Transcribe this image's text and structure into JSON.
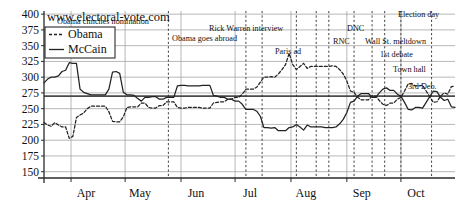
{
  "site_title": "www.electoral-vote.com",
  "legend": {
    "position": "top-left-inside",
    "entries": [
      {
        "name": "Obama",
        "style": "dashed"
      },
      {
        "name": "McCain",
        "style": "solid"
      }
    ]
  },
  "axes": {
    "y_ticks": [
      150,
      175,
      200,
      225,
      250,
      275,
      300,
      325,
      350,
      375,
      400
    ],
    "x_ticks": [
      "Apr",
      "May",
      "Jun",
      "Jul",
      "Aug",
      "Sep",
      "Oct"
    ]
  },
  "events": [
    {
      "label": "Obama clinches nomination",
      "x_day": 69,
      "text_x": 57,
      "text_y": 24,
      "anchor": "start"
    },
    {
      "label": "Obama goes abroad",
      "x_day": 112,
      "text_x": 172,
      "text_y": 41,
      "anchor": "start"
    },
    {
      "label": "Rick Warren interview",
      "x_day": 140,
      "text_x": 209,
      "text_y": 31,
      "anchor": "start"
    },
    {
      "label": "Paris ad",
      "x_day": 121,
      "text_x": 275,
      "text_y": 54,
      "anchor": "start"
    },
    {
      "label": "DNC",
      "x_day": 151,
      "text_x": 347,
      "text_y": 31,
      "anchor": "start"
    },
    {
      "label": "RNC",
      "x_day": 158,
      "text_x": 333,
      "text_y": 44,
      "anchor": "start"
    },
    {
      "label": "Wall St. meltdown",
      "x_day": 172,
      "text_x": 365,
      "text_y": 44,
      "anchor": "start"
    },
    {
      "label": "1st debate",
      "x_day": 182,
      "text_x": 380,
      "text_y": 57,
      "anchor": "start"
    },
    {
      "label": "Town hall",
      "x_day": 189,
      "text_x": 393,
      "text_y": 72,
      "anchor": "start"
    },
    {
      "label": "3rd Deb.",
      "x_day": 198,
      "text_x": 408,
      "text_y": 89,
      "anchor": "start"
    },
    {
      "label": "Election day",
      "x_day": 215,
      "text_x": 398,
      "text_y": 17,
      "anchor": "start"
    }
  ],
  "chart_data": {
    "type": "line",
    "title": "www.electoral-vote.com",
    "subtitle": "Electoral vote predictions, 2008 US presidential election",
    "xlabel": "",
    "ylabel": "Electoral votes",
    "ylim": [
      140,
      405
    ],
    "yticks": [
      150,
      175,
      200,
      225,
      250,
      275,
      300,
      325,
      350,
      375,
      400
    ],
    "grid": true,
    "legend_position": "upper left",
    "reference_line": 270,
    "x_tick_labels": [
      "Apr",
      "May",
      "Jun",
      "Jul",
      "Aug",
      "Sep",
      "Oct"
    ],
    "x_tick_positions": [
      15,
      45,
      76,
      106,
      137,
      168,
      198
    ],
    "x_range": [
      0,
      228
    ],
    "series": [
      {
        "name": "Obama",
        "style": "dashed",
        "color": "#222222",
        "x": [
          0,
          2,
          4,
          6,
          8,
          10,
          12,
          14,
          16,
          18,
          20,
          22,
          24,
          26,
          28,
          30,
          32,
          34,
          36,
          38,
          40,
          42,
          44,
          46,
          48,
          50,
          52,
          54,
          56,
          58,
          60,
          62,
          64,
          66,
          68,
          70,
          72,
          74,
          76,
          78,
          80,
          82,
          84,
          86,
          88,
          90,
          92,
          94,
          96,
          98,
          100,
          102,
          104,
          106,
          108,
          110,
          112,
          114,
          116,
          118,
          120,
          122,
          124,
          126,
          128,
          130,
          132,
          134,
          136,
          138,
          140,
          142,
          144,
          146,
          148,
          150,
          152,
          154,
          156,
          158,
          160,
          162,
          164,
          166,
          168,
          170,
          172,
          174,
          176,
          178,
          180,
          182,
          184,
          186,
          188,
          190,
          192,
          194,
          196,
          198,
          200,
          202,
          204,
          206,
          208,
          210,
          212,
          214,
          216,
          218,
          220,
          222,
          224,
          226,
          228
        ],
        "y": [
          228,
          224,
          222,
          228,
          224,
          221,
          221,
          203,
          206,
          236,
          240,
          243,
          250,
          254,
          254,
          254,
          254,
          254,
          245,
          230,
          229,
          229,
          237,
          252,
          253,
          253,
          253,
          259,
          259,
          252,
          251,
          251,
          255,
          255,
          261,
          261,
          261,
          252,
          251,
          251,
          252,
          252,
          252,
          252,
          251,
          251,
          251,
          259,
          260,
          261,
          261,
          265,
          265,
          268,
          268,
          273,
          281,
          281,
          281,
          284,
          292,
          300,
          300,
          301,
          300,
          305,
          312,
          320,
          338,
          320,
          312,
          317,
          322,
          314,
          317,
          317,
          317,
          317,
          317,
          317,
          318,
          317,
          312,
          305,
          294,
          278,
          276,
          268,
          264,
          264,
          264,
          270,
          270,
          263,
          257,
          255,
          259,
          259,
          265,
          268,
          278,
          289,
          290,
          286,
          286,
          287,
          278,
          269,
          260,
          261,
          270,
          275,
          273,
          285,
          286
        ]
      },
      {
        "name": "McCain",
        "style": "solid",
        "color": "#222222",
        "x": [
          0,
          2,
          4,
          6,
          8,
          10,
          12,
          14,
          16,
          18,
          20,
          22,
          24,
          26,
          28,
          30,
          32,
          34,
          36,
          38,
          40,
          42,
          44,
          46,
          48,
          50,
          52,
          54,
          56,
          58,
          60,
          62,
          64,
          66,
          68,
          70,
          72,
          74,
          76,
          78,
          80,
          82,
          84,
          86,
          88,
          90,
          92,
          94,
          96,
          98,
          100,
          102,
          104,
          106,
          108,
          110,
          112,
          114,
          116,
          118,
          120,
          122,
          124,
          126,
          128,
          130,
          132,
          134,
          136,
          138,
          140,
          142,
          144,
          146,
          148,
          150,
          152,
          154,
          156,
          158,
          160,
          162,
          164,
          166,
          168,
          170,
          172,
          174,
          176,
          178,
          180,
          182,
          184,
          186,
          188,
          190,
          192,
          194,
          196,
          198,
          200,
          202,
          204,
          206,
          208,
          210,
          212,
          214,
          216,
          218,
          220,
          222,
          224,
          226,
          228
        ],
        "y": [
          291,
          297,
          300,
          300,
          302,
          309,
          311,
          323,
          322,
          322,
          281,
          276,
          274,
          272,
          272,
          272,
          272,
          272,
          281,
          308,
          309,
          306,
          276,
          272,
          272,
          271,
          266,
          262,
          268,
          268,
          269,
          269,
          265,
          265,
          268,
          268,
          268,
          286,
          287,
          287,
          286,
          286,
          286,
          286,
          287,
          287,
          287,
          271,
          270,
          268,
          268,
          265,
          265,
          262,
          262,
          257,
          249,
          249,
          249,
          246,
          238,
          220,
          220,
          219,
          220,
          215,
          215,
          215,
          220,
          221,
          225,
          221,
          216,
          224,
          221,
          221,
          221,
          221,
          220,
          220,
          220,
          221,
          226,
          233,
          244,
          260,
          262,
          270,
          274,
          274,
          274,
          268,
          268,
          275,
          281,
          283,
          279,
          279,
          273,
          270,
          260,
          249,
          248,
          252,
          252,
          251,
          260,
          269,
          278,
          277,
          268,
          263,
          265,
          253,
          252
        ]
      }
    ],
    "annotations": [
      "Obama clinches nomination",
      "Obama goes abroad",
      "Rick Warren interview",
      "Paris ad",
      "DNC",
      "RNC",
      "Wall St. meltdown",
      "1st debate",
      "Town hall",
      "3rd Deb.",
      "Election day"
    ]
  }
}
